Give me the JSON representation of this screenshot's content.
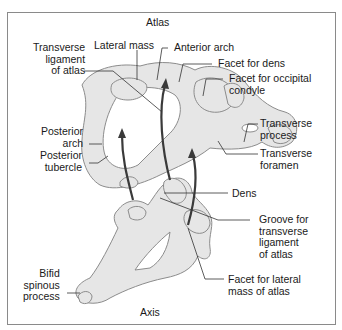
{
  "diagram": {
    "title_top": "Atlas",
    "title_bottom": "Axis",
    "labels": {
      "transverse_ligament": "Transverse\nligament\nof atlas",
      "lateral_mass": "Lateral mass",
      "anterior_arch": "Anterior arch",
      "facet_dens": "Facet for dens",
      "facet_occipital": "Facet for occipital\ncondyle",
      "posterior_arch": "Posterior\narch",
      "posterior_tubercle": "Posterior\ntubercle",
      "transverse_process": "Transverse\nprocess",
      "transverse_foramen": "Transverse\nforamen",
      "dens": "Dens",
      "groove": "Groove for\ntransverse\nligament\nof atlas",
      "bifid_spinous": "Bifid\nspinous\nprocess",
      "facet_lateral": "Facet for lateral\nmass of atlas"
    },
    "colors": {
      "bone_fill": "#e6e6e6",
      "bone_stroke": "#8c8c8c",
      "leader": "#333333",
      "arrow": "#3a3a3a",
      "frame": "#8a8a8a"
    }
  }
}
